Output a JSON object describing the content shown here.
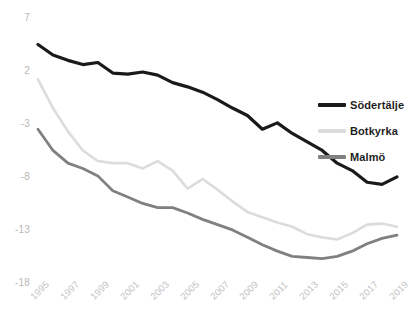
{
  "chart_data": {
    "type": "line",
    "title": "",
    "xlabel": "",
    "ylabel": "",
    "xlim": [
      1995,
      2019
    ],
    "ylim": [
      -18,
      7
    ],
    "grid": false,
    "legend_position": "right",
    "x": [
      1995,
      1996,
      1997,
      1998,
      1999,
      2000,
      2001,
      2002,
      2003,
      2004,
      2005,
      2006,
      2007,
      2008,
      2009,
      2010,
      2011,
      2012,
      2013,
      2014,
      2015,
      2016,
      2017,
      2018,
      2019
    ],
    "xticks": [
      "1995",
      "1997",
      "1999",
      "2001",
      "2003",
      "2005",
      "2007",
      "2009",
      "2011",
      "2013",
      "2015",
      "2017",
      "2019"
    ],
    "yticks": [
      "7",
      "2",
      "-3",
      "-8",
      "-13",
      "-18"
    ],
    "series": [
      {
        "name": "Södertälje",
        "color": "#1a1a1a",
        "values": [
          4.6,
          3.6,
          3.1,
          2.7,
          2.9,
          1.9,
          1.8,
          2.0,
          1.7,
          1.0,
          0.6,
          0.1,
          -0.6,
          -1.4,
          -2.1,
          -3.4,
          -2.8,
          -3.8,
          -4.6,
          -5.4,
          -6.6,
          -7.3,
          -8.4,
          -8.6,
          -7.9
        ]
      },
      {
        "name": "Botkyrka",
        "color": "#dcdcdc",
        "values": [
          1.3,
          -1.4,
          -3.6,
          -5.4,
          -6.4,
          -6.6,
          -6.6,
          -7.1,
          -6.4,
          -7.3,
          -9.0,
          -8.1,
          -9.1,
          -10.2,
          -11.2,
          -11.7,
          -12.2,
          -12.6,
          -13.3,
          -13.6,
          -13.8,
          -13.2,
          -12.4,
          -12.3,
          -12.6
        ]
      },
      {
        "name": "Malmö",
        "color": "#808080",
        "values": [
          -3.4,
          -5.4,
          -6.6,
          -7.1,
          -7.8,
          -9.2,
          -9.8,
          -10.4,
          -10.8,
          -10.8,
          -11.3,
          -11.9,
          -12.4,
          -12.9,
          -13.6,
          -14.3,
          -14.9,
          -15.4,
          -15.5,
          -15.6,
          -15.4,
          -14.9,
          -14.2,
          -13.7,
          -13.4
        ]
      }
    ]
  },
  "legend": {
    "items": [
      {
        "label": "Södertälje",
        "color": "#1a1a1a"
      },
      {
        "label": "Botkyrka",
        "color": "#dcdcdc"
      },
      {
        "label": "Malmö",
        "color": "#808080"
      }
    ]
  }
}
